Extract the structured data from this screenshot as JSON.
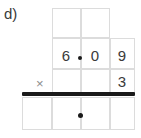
{
  "problem": {
    "label": "d)",
    "operator_symbol": "×",
    "multiplicand": {
      "digits": [
        "6",
        "0",
        "9"
      ],
      "decimal_point": true,
      "decimal_after_index": 0,
      "text": "6.09"
    },
    "multiplier": {
      "digits": [
        "3"
      ],
      "text": "3"
    },
    "answer_row": {
      "digits": [
        "",
        "",
        ""
      ],
      "decimal_point": true,
      "text": ""
    },
    "carry_row": {
      "digits": [
        "",
        ""
      ],
      "text": ""
    }
  },
  "colors": {
    "grid_line": "#dcdcdc",
    "digit_text": "#3a3a3a",
    "operator_text": "#8c8c8c",
    "answer_bar": "#1a1a1a",
    "decimal_dot": "#1a1a1a",
    "background": "#ffffff"
  }
}
